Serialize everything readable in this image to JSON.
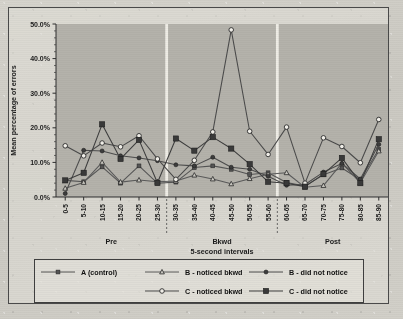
{
  "chart_data": {
    "type": "line",
    "title": "",
    "xlabel": "5-second intervals",
    "ylabel": "Mean percentage of errors",
    "ylim": [
      0,
      50
    ],
    "ytick_labels": [
      "0.0%",
      "10.0%",
      "20.0%",
      "30.0%",
      "40.0%",
      "50.0%"
    ],
    "ytick_values": [
      0,
      10,
      20,
      30,
      40,
      50
    ],
    "grid": false,
    "legend_position": "bottom",
    "categories": [
      "0-5",
      "5-10",
      "10-15",
      "15-20",
      "20-25",
      "25-30",
      "30-35",
      "35-40",
      "40-45",
      "45-50",
      "50-55",
      "55-60",
      "60-65",
      "65-70",
      "70-75",
      "75-80",
      "80-85",
      "85-90"
    ],
    "phases": [
      {
        "label": "Pre",
        "start_index": 0,
        "end_index": 5
      },
      {
        "label": "Bkwd",
        "start_index": 6,
        "end_index": 11
      },
      {
        "label": "Post",
        "start_index": 12,
        "end_index": 17
      }
    ],
    "series": [
      {
        "name": "A (control)",
        "marker": "square-filled",
        "color": "#555555",
        "values": [
          4.8,
          4.4,
          8.7,
          4.0,
          9.0,
          4.0,
          4.3,
          8.5,
          9.0,
          8.0,
          6.5,
          7.0,
          4.2,
          3.2,
          6.4,
          8.4,
          5.0,
          13.8
        ]
      },
      {
        "name": "B - noticed bkwd",
        "marker": "triangle-open",
        "color": "#5a5a5a",
        "values": [
          2.5,
          4.2,
          10.0,
          4.3,
          4.9,
          4.4,
          4.6,
          6.3,
          5.2,
          3.8,
          5.3,
          6.6,
          7.0,
          2.8,
          3.3,
          9.8,
          4.1,
          13.3
        ]
      },
      {
        "name": "B - did not notice",
        "marker": "circle-filled",
        "color": "#4d4d4d",
        "values": [
          1.0,
          13.5,
          13.3,
          11.9,
          11.3,
          10.5,
          9.3,
          9.0,
          11.5,
          8.6,
          8.0,
          6.0,
          3.4,
          3.6,
          7.2,
          9.7,
          5.2,
          15.2
        ]
      },
      {
        "name": "C - noticed bkwd",
        "marker": "circle-open",
        "color": "#4a4a4a",
        "values": [
          14.8,
          11.9,
          15.6,
          14.5,
          17.7,
          11.0,
          5.1,
          10.6,
          18.8,
          48.3,
          19.0,
          12.3,
          20.2,
          4.0,
          17.1,
          14.6,
          9.9,
          22.4
        ]
      },
      {
        "name": "C - did not notice",
        "marker": "square-filled-lg",
        "color": "#3d3d3d",
        "values": [
          4.8,
          7.0,
          21.0,
          11.0,
          16.5,
          4.1,
          16.9,
          13.4,
          17.3,
          14.0,
          9.5,
          4.4,
          4.0,
          3.0,
          6.6,
          11.3,
          4.0,
          16.7
        ]
      }
    ]
  },
  "legend": {
    "items": [
      {
        "label": "A (control)"
      },
      {
        "label": "B - noticed bkwd"
      },
      {
        "label": "B - did not notice"
      },
      {
        "label": "C - noticed bkwd"
      },
      {
        "label": "C - did not notice"
      }
    ]
  }
}
